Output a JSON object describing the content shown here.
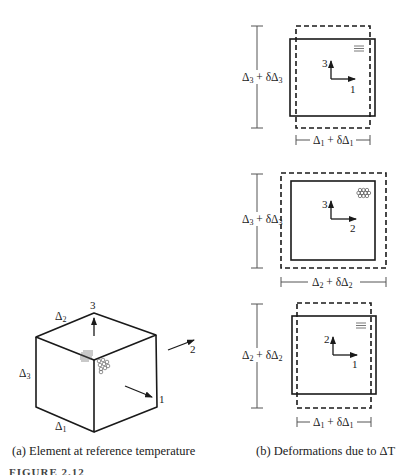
{
  "figure": {
    "number_label": "FIGURE 2.12",
    "panel_a": {
      "caption": "(a) Element at reference temperature",
      "cube": {
        "edge_labels": [
          "Δ1",
          "Δ2",
          "Δ3"
        ],
        "axis_labels": {
          "axis1": "1",
          "axis2": "2",
          "axis3": "3"
        }
      }
    },
    "panel_b": {
      "caption": "(b) Deformations due to ΔT",
      "views": [
        {
          "name": "1-3 plane",
          "vertical_dim": "Δ3 + δΔ3",
          "horizontal_dim": "Δ1 + δΔ1",
          "axis_up": "3",
          "axis_right": "1",
          "fiber_symbol": "parallel-lines"
        },
        {
          "name": "2-3 plane",
          "vertical_dim": "Δ3 + δΔ3",
          "horizontal_dim": "Δ2 + δΔ2",
          "axis_up": "3",
          "axis_right": "2",
          "fiber_symbol": "fiber-ends-circles"
        },
        {
          "name": "1-2 plane",
          "vertical_dim": "Δ2 + δΔ2",
          "horizontal_dim": "Δ1 + δΔ1",
          "axis_up": "2",
          "axis_right": "1",
          "fiber_symbol": "parallel-lines"
        }
      ]
    }
  }
}
